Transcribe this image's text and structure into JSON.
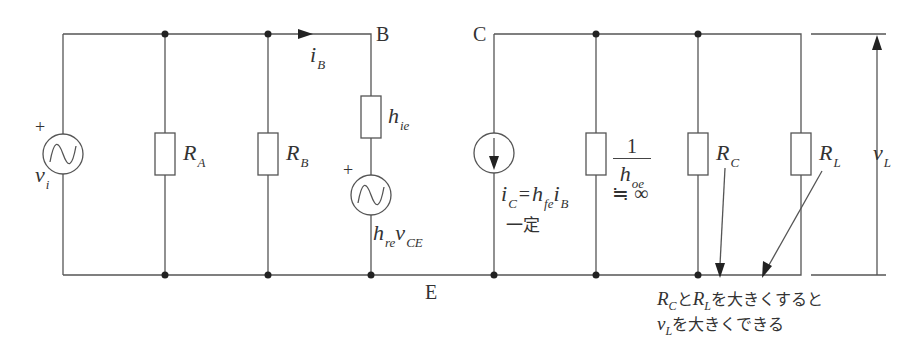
{
  "diagram": {
    "type": "h-parameter equivalent circuit (common emitter)",
    "nodes": {
      "B": "B",
      "C": "C",
      "E": "E"
    },
    "source_input": {
      "sign": "+",
      "var": "v",
      "sub": "i"
    },
    "resistor_A": {
      "var": "R",
      "sub": "A"
    },
    "resistor_B": {
      "var": "R",
      "sub": "B"
    },
    "base_current": {
      "var": "i",
      "sub": "B"
    },
    "h_ie": {
      "var": "h",
      "sub": "ie"
    },
    "feedback_source": {
      "sign": "+",
      "var1": "h",
      "sub1": "re",
      "var2": "v",
      "sub2": "CE"
    },
    "current_source": {
      "var": "i",
      "sub": "C",
      "eq": "=",
      "var2": "h",
      "sub2": "fe",
      "var3": "i",
      "sub3": "B",
      "note": "一定"
    },
    "output_admittance": {
      "num": "1",
      "var": "h",
      "sub": "oe",
      "approx": "≒ ∞"
    },
    "resistor_C": {
      "var": "R",
      "sub": "C"
    },
    "resistor_L": {
      "var": "R",
      "sub": "L"
    },
    "output_voltage": {
      "var": "v",
      "sub": "L"
    },
    "annotation": {
      "line1_r1": "R",
      "line1_s1": "C",
      "line1_mid": "と",
      "line1_r2": "R",
      "line1_s2": "L",
      "line1_end": "を大きくすると",
      "line2_v": "v",
      "line2_s": "L",
      "line2_end": "を大きくできる"
    }
  }
}
